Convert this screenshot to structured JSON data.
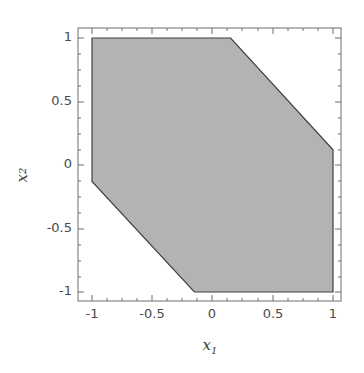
{
  "chart_data": {
    "type": "area",
    "title": "",
    "subtitle": "",
    "xlabel": "x",
    "xlabel_sub": "1",
    "ylabel": "x",
    "ylabel_sub": "2",
    "xlim": [
      -1.1,
      1.1
    ],
    "ylim": [
      -1.1,
      1.1
    ],
    "xticks": [
      -1,
      -0.5,
      0,
      0.5,
      1
    ],
    "xticklabels": [
      "-1",
      "-0.5",
      "0",
      "0.5",
      "1"
    ],
    "yticks": [
      -1,
      -0.5,
      0,
      0.5,
      1
    ],
    "yticklabels": [
      "-1",
      "-0.5",
      "0",
      "0.5",
      "1"
    ],
    "grid": false,
    "legend": null,
    "annotations": [],
    "series": [
      {
        "name": "feasible-region",
        "type": "polygon",
        "fill_color": "#b3b3b3",
        "edge_color": "#404040",
        "edge_width": 1,
        "points": [
          [
            -1.0,
            1.0
          ],
          [
            0.15,
            1.0
          ],
          [
            1.0,
            0.12
          ],
          [
            1.0,
            -1.0
          ],
          [
            -0.15,
            -1.0
          ],
          [
            -1.0,
            -0.13
          ]
        ]
      }
    ]
  },
  "axes": {
    "box_color": "#6e6e6e",
    "tick_color": "#6e6e6e",
    "background": "#ffffff"
  }
}
